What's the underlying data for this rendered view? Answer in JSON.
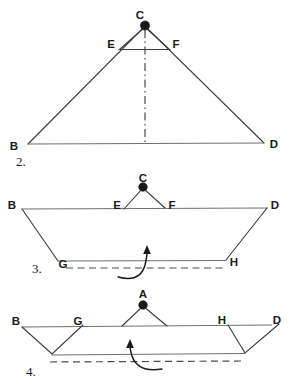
{
  "sheet": {
    "background": "#ffffff",
    "ink": "#1a1a1a",
    "line_color": "#3a3a3a",
    "fold_color": "#4a4a4a",
    "width": 290,
    "height": 385
  },
  "figures": [
    {
      "step_label": "2.",
      "step_pos": {
        "x": 16,
        "y": 165
      },
      "vertex_labels": [
        {
          "name": "C",
          "text": "C",
          "x": 140,
          "y": 19
        },
        {
          "name": "E",
          "text": "E",
          "x": 108,
          "y": 48
        },
        {
          "name": "F",
          "text": "F",
          "x": 172,
          "y": 48
        },
        {
          "name": "B",
          "text": "B",
          "x": 10,
          "y": 150
        },
        {
          "name": "D",
          "text": "D",
          "x": 270,
          "y": 148
        }
      ]
    },
    {
      "step_label": "3.",
      "step_pos": {
        "x": 32,
        "y": 272
      },
      "vertex_labels": [
        {
          "name": "C",
          "text": "C",
          "x": 139,
          "y": 181
        },
        {
          "name": "E",
          "text": "E",
          "x": 114,
          "y": 209
        },
        {
          "name": "F",
          "text": "F",
          "x": 169,
          "y": 209
        },
        {
          "name": "B",
          "text": "B",
          "x": 9,
          "y": 209
        },
        {
          "name": "D",
          "text": "D",
          "x": 269,
          "y": 209
        },
        {
          "name": "G",
          "text": "G",
          "x": 60,
          "y": 267
        },
        {
          "name": "H",
          "text": "H",
          "x": 229,
          "y": 265
        }
      ]
    },
    {
      "step_label": "4.",
      "step_pos": {
        "x": 26,
        "y": 375
      },
      "vertex_labels": [
        {
          "name": "A",
          "text": "A",
          "x": 139,
          "y": 297
        },
        {
          "name": "B",
          "text": "B",
          "x": 13,
          "y": 325
        },
        {
          "name": "G",
          "text": "G",
          "x": 73,
          "y": 325
        },
        {
          "name": "H",
          "text": "H",
          "x": 218,
          "y": 324
        },
        {
          "name": "D",
          "text": "D",
          "x": 273,
          "y": 324
        }
      ]
    }
  ],
  "geometry": {
    "fig2": {
      "apex": {
        "x": 145,
        "y": 26
      },
      "base_left": {
        "x": 28,
        "y": 144
      },
      "base_right": {
        "x": 264,
        "y": 143
      },
      "crease_left": {
        "x": 120,
        "y": 49
      },
      "crease_right": {
        "x": 169,
        "y": 49
      },
      "center_line_bottom": {
        "x": 145,
        "y": 144
      }
    },
    "fig3": {
      "apex": {
        "x": 143,
        "y": 187
      },
      "top_left": {
        "x": 22,
        "y": 209
      },
      "top_right": {
        "x": 267,
        "y": 208
      },
      "crease_left": {
        "x": 124,
        "y": 209
      },
      "crease_right": {
        "x": 165,
        "y": 208
      },
      "fold_left": {
        "x": 58,
        "y": 261
      },
      "fold_right": {
        "x": 226,
        "y": 260
      },
      "dash_line_y": 268,
      "dash_line_x1": 66,
      "dash_line_x2": 224
    },
    "fig4": {
      "apex": {
        "x": 143,
        "y": 306
      },
      "tri_base_left": {
        "x": 122,
        "y": 326
      },
      "tri_base_right": {
        "x": 167,
        "y": 326
      },
      "line_left": {
        "x": 22,
        "y": 327
      },
      "line_right": {
        "x": 272,
        "y": 325
      },
      "flap_left_top_a": {
        "x": 22,
        "y": 327
      },
      "flap_left_top_b": {
        "x": 83,
        "y": 325
      },
      "flap_left_bottom": {
        "x": 52,
        "y": 354
      },
      "flap_right_top_a": {
        "x": 228,
        "y": 325
      },
      "flap_right_top_b": {
        "x": 279,
        "y": 324
      },
      "flap_right_bottom": {
        "x": 245,
        "y": 353
      },
      "base_line_y": 355,
      "dash_line_y": 362
    },
    "arrow_fig3": {
      "tip": {
        "x": 147,
        "y": 246
      },
      "tail": {
        "x": 118,
        "y": 277
      }
    },
    "arrow_fig4": {
      "tip": {
        "x": 130,
        "y": 340
      },
      "tail": {
        "x": 162,
        "y": 369
      }
    }
  }
}
